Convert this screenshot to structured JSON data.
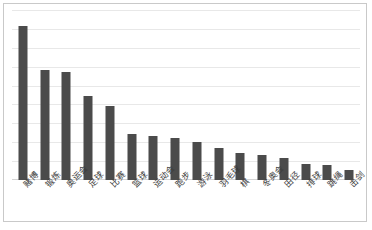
{
  "chart_data": {
    "type": "bar",
    "title": "",
    "subtitle": "",
    "xlabel": "",
    "ylabel": "",
    "grid": true,
    "legend": false,
    "legend_position": "none",
    "axis_tick_labels": [],
    "ylim": [
      0,
      9
    ],
    "gridline_count": 9,
    "bar_color": "#4b4b4b",
    "gridline_color": "#e8e8e8",
    "border_color": "#c9c9c9",
    "categories": [
      "赌博",
      "锻炼",
      "奥运会",
      "足球",
      "比赛",
      "篮球",
      "运动会",
      "跑步",
      "游泳",
      "羽毛球",
      "棋",
      "冬奥会",
      "田径",
      "排球",
      "跳绳",
      "击剑"
    ],
    "values": [
      8.15,
      5.85,
      5.72,
      4.45,
      3.9,
      2.45,
      2.32,
      2.25,
      2.0,
      1.72,
      1.45,
      1.3,
      1.15,
      0.85,
      0.8,
      0.52
    ]
  }
}
